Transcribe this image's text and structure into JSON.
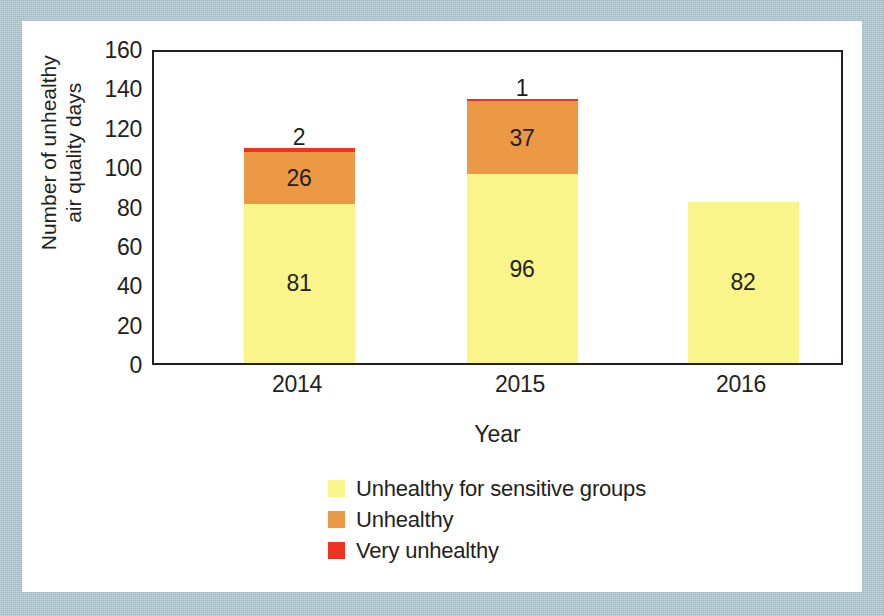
{
  "figure": {
    "mat_color": "#aec9d1",
    "card_color": "#ffffff",
    "axis_color": "#231f20"
  },
  "chart_data": {
    "type": "bar",
    "subtype": "stacked",
    "title": "",
    "xlabel": "Year",
    "ylabel": "Number of unhealthy air quality days",
    "ylabel_line1": "Number of unhealthy",
    "ylabel_line2": "air quality days",
    "categories": [
      "2014",
      "2015",
      "2016"
    ],
    "yticks": [
      "0",
      "20",
      "40",
      "60",
      "80",
      "100",
      "120",
      "140",
      "160"
    ],
    "ylim": [
      0,
      160
    ],
    "grid": false,
    "legend_position": "bottom",
    "series": [
      {
        "name": "Unhealthy for sensitive groups",
        "color": "#f9f58b",
        "values": [
          81,
          96,
          82
        ],
        "labels": [
          "81",
          "96",
          "82"
        ]
      },
      {
        "name": "Unhealthy",
        "color": "#eb9945",
        "values": [
          26,
          37,
          0
        ],
        "labels": [
          "26",
          "37",
          ""
        ]
      },
      {
        "name": "Very unhealthy",
        "color": "#ee3322",
        "values": [
          2,
          1,
          0
        ],
        "labels": [
          "2",
          "1",
          ""
        ]
      }
    ],
    "totals": [
      109,
      134,
      82
    ]
  },
  "legend": {
    "items": [
      {
        "label": "Unhealthy for sensitive groups",
        "color": "#f9f58b"
      },
      {
        "label": "Unhealthy",
        "color": "#eb9945"
      },
      {
        "label": "Very unhealthy",
        "color": "#ee3322"
      }
    ]
  }
}
